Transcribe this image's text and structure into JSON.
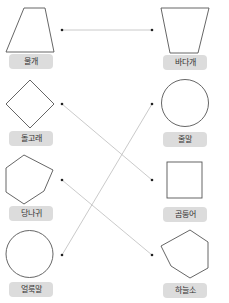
{
  "colors": {
    "shape_stroke": "#555555",
    "line_stroke": "#bdbdbd",
    "dot_fill": "#222222",
    "label_bg": "#dcdcdc",
    "label_text": "#333333"
  },
  "left_items": [
    {
      "label": "물개",
      "shape": "trapezoid"
    },
    {
      "label": "돌고래",
      "shape": "diamond"
    },
    {
      "label": "당나귀",
      "shape": "hexagon"
    },
    {
      "label": "얼룩말",
      "shape": "circle"
    }
  ],
  "right_items": [
    {
      "label": "바다개",
      "shape": "inverted-trapezoid"
    },
    {
      "label": "줄말",
      "shape": "circle"
    },
    {
      "label": "곰둥어",
      "shape": "square"
    },
    {
      "label": "하늘소",
      "shape": "hexagon"
    }
  ],
  "connections": [
    {
      "from": "물개",
      "to": "바다개"
    },
    {
      "from": "돌고래",
      "to": "곰둥어"
    },
    {
      "from": "당나귀",
      "to": "하늘소"
    },
    {
      "from": "얼룩말",
      "to": "줄말"
    }
  ]
}
